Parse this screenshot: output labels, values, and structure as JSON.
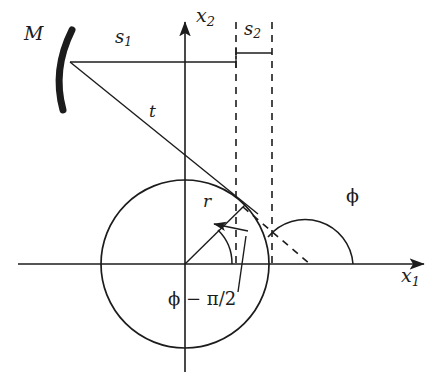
{
  "figure": {
    "type": "geometry-optics-diagram",
    "title": "",
    "background_color": "#ffffff",
    "stroke_color": "#1c1c1c",
    "label_color": "#1c1c1c",
    "width": 448,
    "height": 384
  },
  "axes": {
    "origin": {
      "x": 185,
      "y": 264
    },
    "horizontal": {
      "label": "x",
      "subscript": "1",
      "label_x": 404,
      "label_y": 272,
      "start_x": 18,
      "end_x": 430,
      "y": 264,
      "arrow": "right"
    },
    "vertical": {
      "label": "x",
      "subscript": "2",
      "label_x": 196,
      "label_y": 12,
      "start_y": 372,
      "end_y": 16,
      "x": 185,
      "arrow": "up"
    }
  },
  "circle": {
    "name": "particle-circle",
    "center_x": 185,
    "center_y": 264,
    "radius": 84
  },
  "mirror": {
    "label": "M",
    "label_x": 28,
    "label_y": 28,
    "description": "thick concave curved arc",
    "top_x": 72,
    "top_y": 32,
    "bottom_x": 62,
    "bottom_y": 108,
    "vertex_x": 56,
    "vertex_y": 70,
    "focus_x": 70,
    "focus_y": 62,
    "thickness": 6
  },
  "segments": {
    "s1": {
      "label": "s",
      "subscript": "1",
      "label_x": 118,
      "label_y": 36,
      "y": 62,
      "start_x": 70,
      "end_x": 236,
      "tick_height": 8
    },
    "s2": {
      "label": "s",
      "subscript": "2",
      "label_x": 247,
      "label_y": 28,
      "y": 53,
      "start_x": 236,
      "end_x": 272,
      "tick_height": 8
    },
    "t": {
      "label": "t",
      "label_x": 152,
      "label_y": 104,
      "start_x": 70,
      "start_y": 62,
      "end_x": 256,
      "end_y": 212
    },
    "r": {
      "label": "r",
      "label_x": 205,
      "label_y": 196,
      "start_x": 185,
      "start_y": 264,
      "end_x": 245,
      "end_y": 205
    }
  },
  "dashed_lines": {
    "vertical_left": {
      "x": 236,
      "y_top": 22,
      "y_bottom": 268
    },
    "vertical_right": {
      "x": 272,
      "y_top": 22,
      "y_bottom": 268
    },
    "ray": {
      "start_x": 243,
      "start_y": 207,
      "end_x": 310,
      "end_y": 264
    }
  },
  "angles": {
    "phi": {
      "label": "ϕ",
      "label_x": 352,
      "label_y": 198,
      "vertex_x": 305,
      "vertex_y": 264,
      "radius": 48,
      "start_deg": 0,
      "end_deg": 140,
      "measured_from": "positive x1 axis"
    },
    "phi_minus_half_pi": {
      "label": "ϕ − π/2",
      "label_x": 172,
      "label_y": 292,
      "vertex_x": 185,
      "vertex_y": 264,
      "radius": 47,
      "start_deg": 0,
      "end_deg": 45,
      "leader_from_x": 233,
      "leader_from_y": 290,
      "leader_to_x": 216,
      "leader_to_y": 231,
      "arrow": "toward-arc"
    }
  },
  "annotations": {
    "arrow_marker_size": 9
  }
}
